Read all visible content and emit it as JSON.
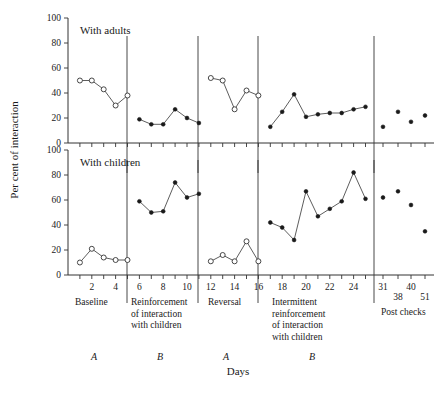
{
  "figure": {
    "ylabel": "Per cent of interaction",
    "xlabel": "Days",
    "panels": [
      {
        "title": "With adults"
      },
      {
        "title": "With children"
      }
    ],
    "y_ticks": [
      "0",
      "20",
      "40",
      "60",
      "80",
      "100"
    ],
    "x_ticks": [
      "2",
      "4",
      "6",
      "8",
      "10",
      "12",
      "14",
      "16",
      "18",
      "20",
      "22",
      "24"
    ],
    "postcheck_ticks": [
      "31",
      "38",
      "40",
      "51"
    ],
    "phase_labels": [
      "Baseline",
      "Reinforcement of interaction with children",
      "Reversal",
      "Intermittent reinforcement of interaction with children",
      "Post checks"
    ],
    "phase_letters": [
      "A",
      "B",
      "A",
      "B"
    ],
    "colors": {
      "ink": "#1a1a1a",
      "axis": "#333333",
      "marker_fill_open": "#ffffff"
    }
  },
  "chart_data": {
    "type": "line",
    "xlabel": "Days",
    "ylabel": "Per cent of interaction",
    "ylim": [
      0,
      100
    ],
    "xlim": [
      0,
      26
    ],
    "grid": false,
    "legend": "none",
    "panels": [
      {
        "name": "With adults",
        "series": [
          {
            "name": "Baseline",
            "marker": "open-circle",
            "phase": "A",
            "x": [
              1,
              2,
              3,
              4,
              5
            ],
            "values": [
              50,
              50,
              43,
              30,
              38
            ]
          },
          {
            "name": "Reinforcement of interaction with children",
            "marker": "filled-circle",
            "phase": "B",
            "x": [
              6,
              7,
              8,
              9,
              10,
              11
            ],
            "values": [
              19,
              15,
              15,
              27,
              20,
              16
            ]
          },
          {
            "name": "Reversal",
            "marker": "open-circle",
            "phase": "A",
            "x": [
              12,
              13,
              14,
              15,
              16
            ],
            "values": [
              52,
              50,
              27,
              42,
              38
            ]
          },
          {
            "name": "Intermittent reinforcement of interaction with children",
            "marker": "filled-circle",
            "phase": "B",
            "x": [
              17,
              18,
              19,
              20,
              21,
              22,
              23,
              24,
              25
            ],
            "values": [
              13,
              25,
              39,
              21,
              23,
              24,
              24,
              27,
              29
            ]
          },
          {
            "name": "Post checks",
            "marker": "filled-circle",
            "phase": "",
            "x": [
              31,
              38,
              40,
              51
            ],
            "values": [
              13,
              25,
              17,
              22
            ]
          }
        ]
      },
      {
        "name": "With children",
        "series": [
          {
            "name": "Baseline",
            "marker": "open-circle",
            "phase": "A",
            "x": [
              1,
              2,
              3,
              4,
              5
            ],
            "values": [
              10,
              21,
              14,
              12,
              12
            ]
          },
          {
            "name": "Reinforcement of interaction with children",
            "marker": "filled-circle",
            "phase": "B",
            "x": [
              6,
              7,
              8,
              9,
              10,
              11
            ],
            "values": [
              59,
              50,
              51,
              74,
              62,
              65
            ]
          },
          {
            "name": "Reversal",
            "marker": "open-circle",
            "phase": "A",
            "x": [
              12,
              13,
              14,
              15,
              16
            ],
            "values": [
              11,
              16,
              11,
              27,
              11
            ]
          },
          {
            "name": "Intermittent reinforcement of interaction with children",
            "marker": "filled-circle",
            "phase": "B",
            "x": [
              17,
              18,
              19,
              20,
              21,
              22,
              23,
              24,
              25
            ],
            "values": [
              42,
              38,
              28,
              67,
              47,
              53,
              59,
              82,
              61
            ]
          },
          {
            "name": "Post checks",
            "marker": "filled-circle",
            "phase": "",
            "x": [
              31,
              38,
              40,
              51
            ],
            "values": [
              62,
              67,
              56,
              35
            ]
          }
        ]
      }
    ]
  }
}
